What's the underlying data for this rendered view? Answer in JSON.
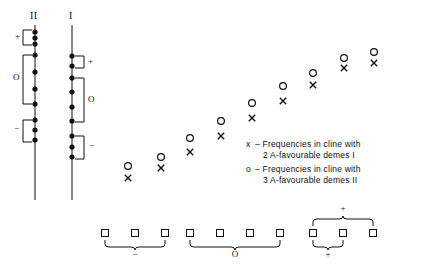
{
  "figure": {
    "axes": [
      {
        "name": "II",
        "label": "II",
        "x": 35,
        "top": 25,
        "bottom": 200,
        "dots": [
          32,
          38,
          44,
          55,
          72,
          89,
          104,
          120,
          130,
          140
        ],
        "brackets": [
          {
            "label": "+",
            "y1": 30,
            "y2": 45,
            "side": "left"
          },
          {
            "label": "O",
            "y1": 55,
            "y2": 104,
            "side": "left"
          },
          {
            "label": "−",
            "y1": 120,
            "y2": 142,
            "side": "left"
          }
        ]
      },
      {
        "name": "I",
        "label": "I",
        "x": 72,
        "top": 25,
        "bottom": 200,
        "dots": [
          56,
          66,
          78,
          92,
          107,
          121,
          136,
          147,
          157
        ],
        "brackets": [
          {
            "label": "+",
            "y1": 56,
            "y2": 68,
            "side": "right"
          },
          {
            "label": "O",
            "y1": 78,
            "y2": 122,
            "side": "right"
          },
          {
            "label": "−",
            "y1": 136,
            "y2": 159,
            "side": "right"
          }
        ]
      }
    ],
    "scatter": {
      "x_series": {
        "marker": "x",
        "points": [
          {
            "x": 128,
            "y": 178
          },
          {
            "x": 161,
            "y": 168
          },
          {
            "x": 190,
            "y": 152
          },
          {
            "x": 221,
            "y": 136
          },
          {
            "x": 252,
            "y": 118
          },
          {
            "x": 283,
            "y": 101
          },
          {
            "x": 313,
            "y": 85
          },
          {
            "x": 344,
            "y": 68
          },
          {
            "x": 374,
            "y": 63
          }
        ]
      },
      "o_series": {
        "marker": "o",
        "points": [
          {
            "x": 128,
            "y": 166
          },
          {
            "x": 161,
            "y": 157
          },
          {
            "x": 190,
            "y": 138
          },
          {
            "x": 221,
            "y": 121
          },
          {
            "x": 252,
            "y": 103
          },
          {
            "x": 283,
            "y": 86
          },
          {
            "x": 313,
            "y": 73
          },
          {
            "x": 344,
            "y": 58
          },
          {
            "x": 374,
            "y": 52
          }
        ]
      }
    },
    "legend": {
      "entries": [
        {
          "marker": "x",
          "dash": "–",
          "line1": "Frequencies in cline with",
          "line2": "2 A-favourable demes I"
        },
        {
          "marker": "o",
          "dash": "–",
          "line1": "Frequencies in cline with",
          "line2": "3 A-favourable demes II"
        }
      ]
    },
    "deme_row": {
      "groups": [
        {
          "squares": [
            105,
            135,
            165
          ],
          "braces": [
            {
              "label": "−",
              "from": 105,
              "to": 165,
              "position": "below"
            }
          ]
        },
        {
          "squares": [
            190,
            220,
            250,
            280
          ],
          "braces": [
            {
              "label": "O",
              "from": 190,
              "to": 280,
              "position": "below"
            }
          ]
        },
        {
          "squares": [
            313,
            343,
            373
          ],
          "braces": [
            {
              "label": "+",
              "from": 313,
              "to": 373,
              "position": "above"
            },
            {
              "label": "+",
              "from": 313,
              "to": 343,
              "position": "below"
            }
          ]
        }
      ]
    }
  }
}
